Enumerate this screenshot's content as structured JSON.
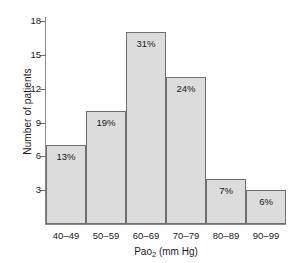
{
  "chart_data": {
    "type": "bar",
    "title": "",
    "subtitle": "",
    "xlabel_prefix": "Pao",
    "xlabel_sub": "2",
    "xlabel_suffix": " (mm Hg)",
    "xlabel": "Pao2 (mm Hg)",
    "ylabel": "Number of patients",
    "categories": [
      "40–49",
      "50–59",
      "60–69",
      "70–79",
      "80–89",
      "90–99"
    ],
    "values": [
      7,
      10,
      17,
      13,
      4,
      3
    ],
    "data_labels": [
      "13%",
      "19%",
      "31%",
      "24%",
      "7%",
      "6%"
    ],
    "percentages": [
      13,
      19,
      31,
      24,
      7,
      6
    ],
    "ylim": [
      0,
      18.8
    ],
    "yticks": [
      3,
      6,
      9,
      12,
      15,
      18
    ],
    "ytick_labels": [
      "3",
      "6",
      "9",
      "12",
      "15",
      "18"
    ],
    "grid": false,
    "legend": null,
    "legend_position": "none",
    "bar_fill_color": "#dcdcdc",
    "bar_border_color": "#6f6f6f",
    "axis_color": "#8a8a8a",
    "text_color": "#1a1a1a",
    "background_color": "#ffffff"
  }
}
